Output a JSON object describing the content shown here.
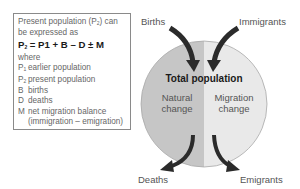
{
  "legend": {
    "intro_1": "Present population (P",
    "intro_sub": "2",
    "intro_2": ") can",
    "intro_3": "be expressed as",
    "equation_p": "P",
    "equation_sub": "2",
    "equation_rest": " = P1 + B – D ± M",
    "where": "where",
    "definitions": [
      {
        "symbol": "P",
        "sub": "1",
        "text": "earlier population"
      },
      {
        "symbol": "P",
        "sub": "2",
        "text": "present population"
      },
      {
        "symbol": "B",
        "sub": "",
        "text": "births"
      },
      {
        "symbol": "D",
        "sub": "",
        "text": "deaths"
      },
      {
        "symbol": "M",
        "sub": "",
        "text": "net migration balance"
      }
    ],
    "migration_note": "(immigration – emigration)"
  },
  "diagram": {
    "center_title": "Total population",
    "left_half": {
      "line1": "Natural",
      "line2": "change"
    },
    "right_half": {
      "line1": "Migration",
      "line2": "change"
    },
    "inflows": {
      "left": "Births",
      "right": "Immigrants"
    },
    "outflows": {
      "left": "Deaths",
      "right": "Emigrants"
    },
    "colors": {
      "left_half": "#c6c6c6",
      "right_half": "#e9e9e9",
      "arrow": "#2b2b2b",
      "outline": "#a8a8a8"
    }
  }
}
